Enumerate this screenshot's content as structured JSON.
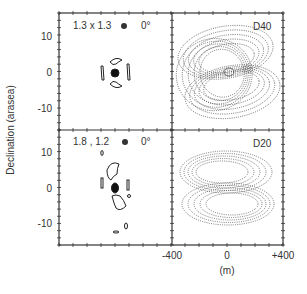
{
  "figure": {
    "y_axis_label": "Declination (arasea)",
    "x_axis_unit": "(m)",
    "x_ticks": [
      "-400",
      "0",
      "+400"
    ],
    "y_ticks": [
      "10",
      "0",
      "-10"
    ],
    "panels": [
      {
        "id": "top-left",
        "label": "1.3 x 1.3",
        "angle": "0°"
      },
      {
        "id": "top-right",
        "label": "D40"
      },
      {
        "id": "bottom-left",
        "label": "1.8 , 1.2",
        "angle": "0°"
      },
      {
        "id": "bottom-right",
        "label": "D20"
      }
    ]
  },
  "chart_data": {
    "type": "heatmap",
    "title": "",
    "ylabel": "Declination (arasea)",
    "xlabel": "(m)",
    "x_ticks": [
      -400,
      0,
      400
    ],
    "y_ticks": [
      10,
      0,
      -10
    ],
    "y_range": [
      -15,
      15
    ],
    "x_range": [
      -400,
      400
    ],
    "panels": [
      {
        "position": "top-left",
        "beam": "1.3 x 1.3",
        "angle": "0°",
        "style": "solid contours, compact central source with arcs"
      },
      {
        "position": "top-right",
        "label": "D40",
        "style": "dotted elliptical fringes, tilted"
      },
      {
        "position": "bottom-left",
        "beam": "1.8 , 1.2",
        "angle": "0°",
        "style": "solid contours, elongated central source with arcs"
      },
      {
        "position": "bottom-right",
        "label": "D20",
        "style": "dotted horizontal elliptical fringes"
      }
    ]
  }
}
